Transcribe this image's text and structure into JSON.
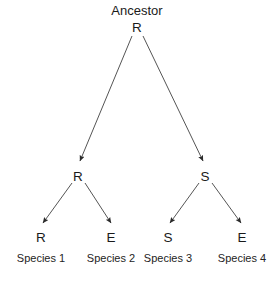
{
  "diagram": {
    "type": "phylogenetic-tree",
    "title": "Ancestor",
    "background_color": "#ffffff",
    "edge_color": "#555555",
    "text_color": "#1a1a1a",
    "root": {
      "title": "Ancestor",
      "state": "R",
      "x": 137,
      "title_y": 10,
      "state_y": 27
    },
    "internal_nodes": [
      {
        "state": "R",
        "x": 78,
        "y": 176,
        "arrow_tip_x": 79,
        "arrow_tip_y": 163
      },
      {
        "state": "S",
        "x": 205,
        "y": 176,
        "arrow_tip_x": 204,
        "arrow_tip_y": 163
      }
    ],
    "leaves": [
      {
        "state": "R",
        "caption": "Species 1",
        "x": 41,
        "state_y": 237,
        "caption_y": 258,
        "arrow_tip_x": 42,
        "arrow_tip_y": 225
      },
      {
        "state": "E",
        "caption": "Species 2",
        "x": 111,
        "state_y": 237,
        "caption_y": 258,
        "arrow_tip_x": 112,
        "arrow_tip_y": 225
      },
      {
        "state": "S",
        "caption": "Species 3",
        "x": 168,
        "state_y": 237,
        "caption_y": 258,
        "arrow_tip_x": 169,
        "arrow_tip_y": 225
      },
      {
        "state": "E",
        "caption": "Species 4",
        "x": 242,
        "state_y": 237,
        "caption_y": 258,
        "arrow_tip_x": 243,
        "arrow_tip_y": 225
      }
    ],
    "edges": [
      {
        "name": "root-to-left-internal",
        "from_x": 132,
        "from_y": 36,
        "to_x": 80,
        "to_y": 161
      },
      {
        "name": "root-to-right-internal",
        "from_x": 143,
        "from_y": 36,
        "to_x": 203,
        "to_y": 161
      },
      {
        "name": "left-internal-to-species-1",
        "from_x": 72,
        "from_y": 183,
        "to_x": 43,
        "to_y": 223
      },
      {
        "name": "left-internal-to-species-2",
        "from_x": 85,
        "from_y": 183,
        "to_x": 111,
        "to_y": 223
      },
      {
        "name": "right-internal-to-species-3",
        "from_x": 199,
        "from_y": 183,
        "to_x": 170,
        "to_y": 223
      },
      {
        "name": "right-internal-to-species-4",
        "from_x": 212,
        "from_y": 183,
        "to_x": 241,
        "to_y": 223
      }
    ]
  }
}
